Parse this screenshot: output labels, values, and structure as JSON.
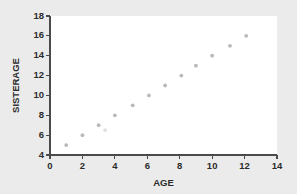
{
  "chart_data": {
    "type": "scatter",
    "title": "",
    "xlabel": "AGE",
    "ylabel": "SISTERAGE",
    "xlim": [
      0,
      14
    ],
    "ylim": [
      4,
      18
    ],
    "xticks": [
      0,
      2,
      4,
      6,
      8,
      10,
      12,
      14
    ],
    "yticks": [
      4,
      6,
      8,
      10,
      12,
      14,
      16,
      18
    ],
    "grid": false,
    "legend": null,
    "marker_color": "#b9b9b9",
    "background_color": "#ebebeb",
    "plot_background_color": "#ffffff",
    "axis_color": "#4a4a4a",
    "points": [
      {
        "x": 1.0,
        "y": 5.0
      },
      {
        "x": 2.0,
        "y": 6.0
      },
      {
        "x": 3.0,
        "y": 7.0
      },
      {
        "x": 3.4,
        "y": 6.5,
        "faint": true
      },
      {
        "x": 4.0,
        "y": 8.0
      },
      {
        "x": 5.1,
        "y": 9.0
      },
      {
        "x": 6.1,
        "y": 10.0
      },
      {
        "x": 7.1,
        "y": 11.0
      },
      {
        "x": 8.1,
        "y": 12.0
      },
      {
        "x": 9.0,
        "y": 13.0
      },
      {
        "x": 10.0,
        "y": 14.0
      },
      {
        "x": 11.1,
        "y": 15.0
      },
      {
        "x": 12.1,
        "y": 16.0
      }
    ]
  }
}
